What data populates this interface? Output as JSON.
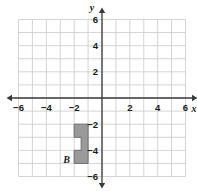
{
  "chart_data": {
    "type": "scatter",
    "title": "",
    "xlabel": "x",
    "ylabel": "y",
    "xlim": [
      -6,
      6
    ],
    "ylim": [
      -6,
      6
    ],
    "grid": true,
    "grid_step": 1,
    "legend": "none",
    "x_tick_labels": [
      "−6",
      "−4",
      "−2",
      "2",
      "4",
      "6"
    ],
    "x_tick_values": [
      -6,
      -4,
      -2,
      2,
      4,
      6
    ],
    "y_tick_labels": [
      "6",
      "4",
      "2",
      "−2",
      "−4",
      "−6"
    ],
    "y_tick_values": [
      6,
      4,
      2,
      -2,
      -4,
      -6
    ],
    "axis_arrows": [
      "left",
      "right",
      "up",
      "down"
    ],
    "shapes": [
      {
        "name": "B",
        "label": "B",
        "label_position": {
          "x": -2.55,
          "y": -4.95
        },
        "fill": "#9a9a9a",
        "stroke": "#6e6e6e",
        "vertices": [
          {
            "x": -2,
            "y": -2
          },
          {
            "x": -1,
            "y": -2
          },
          {
            "x": -1,
            "y": -5
          },
          {
            "x": -2,
            "y": -5
          },
          {
            "x": -2,
            "y": -4
          },
          {
            "x": -1.5,
            "y": -4
          },
          {
            "x": -1.5,
            "y": -3
          },
          {
            "x": -2,
            "y": -3
          }
        ]
      }
    ]
  },
  "colors": {
    "grid_line": "#c9c9c9",
    "axis_line": "#3a3a3a",
    "shape_fill": "#9a9a9a",
    "shape_stroke": "#6e6e6e",
    "text": "#1a1a1a",
    "background": "#ffffff"
  },
  "axis_labels": {
    "x": "x",
    "y": "y"
  }
}
